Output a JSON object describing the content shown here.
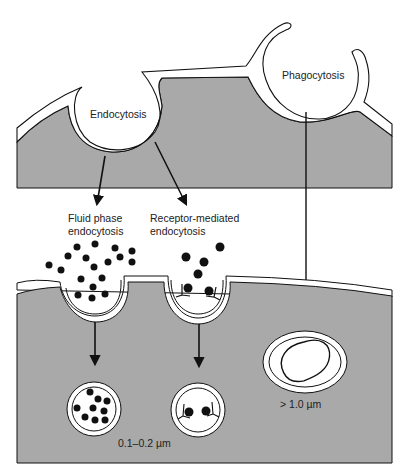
{
  "diagram": {
    "type": "biology-schematic",
    "colors": {
      "cytoplasm": "#a9a9a9",
      "membrane": "#ffffff",
      "outline": "#111111",
      "particles": "#111111"
    },
    "labels": {
      "endocytosis": "Endocytosis",
      "phagocytosis": "Phagocytosis",
      "fluid_phase_line1": "Fluid phase",
      "fluid_phase_line2": "endocytosis",
      "receptor_line1": "Receptor-mediated",
      "receptor_line2": "endocytosis",
      "small_vesicle_size": "0.1–0.2 µm",
      "phagosome_size": "> 1.0 µm"
    },
    "upper_panel": {
      "title": "Cell surface invaginations",
      "pits": [
        "Endocytosis",
        "Phagocytosis"
      ],
      "arrows": [
        {
          "from": "Endocytosis",
          "to": "Fluid phase endocytosis"
        },
        {
          "from": "Endocytosis",
          "to": "Receptor-mediated endocytosis"
        },
        {
          "from": "Phagocytosis",
          "to": "Phagosome"
        }
      ]
    },
    "lower_panel": {
      "pits": [
        {
          "name": "Fluid phase endocytosis pit",
          "particles": "many small dots"
        },
        {
          "name": "Receptor-mediated endocytosis pit",
          "particles": "ligands bound to receptors"
        }
      ],
      "vesicles": [
        {
          "name": "Fluid phase vesicle",
          "size": "0.1–0.2 µm"
        },
        {
          "name": "Receptor-mediated vesicle",
          "size": "0.1–0.2 µm"
        },
        {
          "name": "Phagosome",
          "size": "> 1.0 µm"
        }
      ]
    }
  }
}
